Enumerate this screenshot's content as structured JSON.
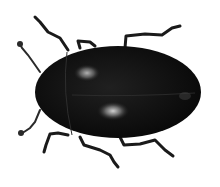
{
  "image": {
    "subject": "black beetle, dorsal view",
    "background_color": "#ffffff",
    "body_color": "#0d0d0d",
    "highlight_color": "#9a9a9a",
    "leg_color": "#1a1a1a"
  }
}
